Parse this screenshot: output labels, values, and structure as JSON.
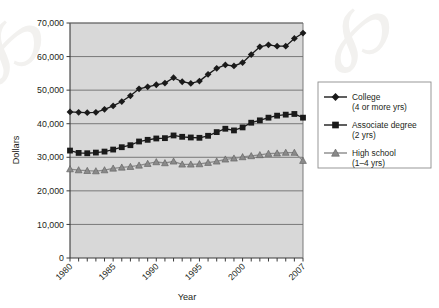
{
  "chart_data": {
    "type": "line",
    "title": "",
    "xlabel": "Year",
    "ylabel": "Dollars",
    "xlim": [
      1980,
      2007
    ],
    "ylim": [
      0,
      70000
    ],
    "ytick_labels": [
      "0",
      "10,000",
      "20,000",
      "30,000",
      "40,000",
      "50,000",
      "60,000",
      "70,000"
    ],
    "ytick_values": [
      0,
      10000,
      20000,
      30000,
      40000,
      50000,
      60000,
      70000
    ],
    "xtick_labels": [
      "1980",
      "1985",
      "1990",
      "1995",
      "2000",
      "2007"
    ],
    "xtick_values": [
      1980,
      1985,
      1990,
      1995,
      2000,
      2007
    ],
    "grid": "horizontal",
    "legend_position": "right",
    "x": [
      1980,
      1981,
      1982,
      1983,
      1984,
      1985,
      1986,
      1987,
      1988,
      1989,
      1990,
      1991,
      1992,
      1993,
      1994,
      1995,
      1996,
      1997,
      1998,
      1999,
      2000,
      2001,
      2002,
      2003,
      2004,
      2005,
      2006,
      2007
    ],
    "series": [
      {
        "name": "College (4 or more yrs)",
        "marker": "diamond",
        "color": "#1a1a1a",
        "values": [
          43500,
          43400,
          43300,
          43400,
          44300,
          45300,
          46600,
          48300,
          50400,
          51000,
          51600,
          52100,
          53700,
          52500,
          52000,
          52700,
          54700,
          56500,
          57500,
          57200,
          58200,
          60600,
          62900,
          63500,
          63100,
          63100,
          65400,
          67000
        ]
      },
      {
        "name": "Associate degree (2 yrs)",
        "marker": "square",
        "color": "#1a1a1a",
        "values": [
          32000,
          31300,
          31200,
          31400,
          31700,
          32300,
          33000,
          33600,
          34700,
          35200,
          35600,
          35700,
          36500,
          36100,
          35900,
          35800,
          36400,
          37500,
          38500,
          38000,
          38900,
          40300,
          41000,
          41800,
          42400,
          42700,
          42900,
          41800
        ]
      },
      {
        "name": "High school (1–4 yrs)",
        "marker": "triangle",
        "color": "#8a8a8a",
        "values": [
          26500,
          26200,
          26000,
          25900,
          26200,
          26700,
          27000,
          27200,
          27600,
          28100,
          28600,
          28300,
          28800,
          27900,
          27900,
          28000,
          28400,
          28800,
          29400,
          29700,
          30100,
          30400,
          30700,
          31100,
          31200,
          31400,
          31400,
          29000
        ]
      }
    ]
  },
  "axes": {
    "y_title": "Dollars",
    "x_title": "Year"
  },
  "legend": {
    "items": [
      {
        "label_line1": "College",
        "label_line2": "(4 or more yrs)",
        "marker": "diamond-marker"
      },
      {
        "label_line1": "Associate degree",
        "label_line2": "(2 yrs)",
        "marker": "square-marker"
      },
      {
        "label_line1": "High school",
        "label_line2": "(1–4 yrs)",
        "marker": "triangle-marker"
      }
    ]
  },
  "colors": {
    "plot_background": "#d8d8d8",
    "gridline": "#6e6e6e",
    "axis": "#3a3a3a",
    "dark_series": "#1a1a1a",
    "light_series": "#8a8a8a",
    "page_background": "#ffffff"
  },
  "watermark": {
    "left_glyph": "℘",
    "right_glyph": "℘"
  }
}
